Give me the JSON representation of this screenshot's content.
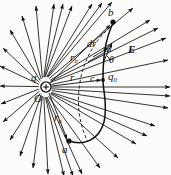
{
  "figure": {
    "type": "physics-diagram",
    "background_color": "#fbfbf9",
    "ink_color": "#101010"
  },
  "labels": {
    "source_charge": "q",
    "origin": "O",
    "point_b": "b",
    "point_a": "a",
    "point_c": "c",
    "radius_general": "r",
    "radius_b": "r",
    "radius_b_sub": "b",
    "radius_a": "r",
    "radius_a_sub": "a",
    "displacement_radial": "dr",
    "displacement_path": "dl",
    "angle": "θ",
    "field": "E",
    "test_charge": "q",
    "test_charge_sub": "0"
  },
  "geometry": {
    "origin_x": 46,
    "origin_y": 87,
    "point_b_x": 113,
    "point_b_y": 22,
    "point_a_x": 69,
    "point_a_y": 141,
    "point_c_x": 104,
    "point_c_y": 80,
    "charge_marker_radius": 5,
    "field_line_count": 34
  },
  "elements": {
    "field_lines": "radial arrows emanating outward from point charge",
    "path_curve": "solid curved path from a to b",
    "dashed_arc": "dashed circular arc of constant radius through b",
    "radial_segments": "straight radius lines r, r-sub-a, r-sub-b from origin"
  }
}
